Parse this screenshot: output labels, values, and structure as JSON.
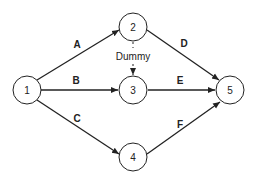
{
  "diagram": {
    "type": "activity-on-arrow network",
    "nodes": [
      {
        "id": "1",
        "label": "1"
      },
      {
        "id": "2",
        "label": "2"
      },
      {
        "id": "3",
        "label": "3"
      },
      {
        "id": "4",
        "label": "4"
      },
      {
        "id": "5",
        "label": "5"
      }
    ],
    "edges": [
      {
        "from": "1",
        "to": "2",
        "label": "A"
      },
      {
        "from": "1",
        "to": "3",
        "label": "B"
      },
      {
        "from": "1",
        "to": "4",
        "label": "C"
      },
      {
        "from": "2",
        "to": "5",
        "label": "D"
      },
      {
        "from": "3",
        "to": "5",
        "label": "E"
      },
      {
        "from": "4",
        "to": "5",
        "label": "F"
      },
      {
        "from": "2",
        "to": "3",
        "label": "Dummy",
        "dashed": true
      }
    ]
  }
}
